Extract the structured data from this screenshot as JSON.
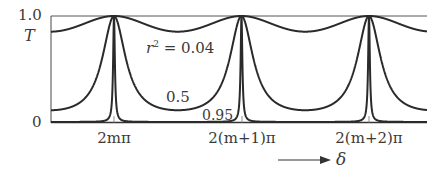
{
  "chart_data": {
    "type": "line",
    "title": "",
    "xlabel": "δ",
    "ylabel": "T",
    "function": "T = 1 / (1 + F sin^2(δ/2)), F = 4r^2/(1-r^2)^2",
    "x_tick_labels": [
      "2mπ",
      "2(m+1)π",
      "2(m+2)π"
    ],
    "x_tick_positions_rad_offset": [
      0,
      6.2832,
      12.5664
    ],
    "x_range_rad_offset": [
      -3.14,
      15.0
    ],
    "y_tick_labels": [
      "0",
      "1.0"
    ],
    "ylim": [
      0,
      1.0
    ],
    "grid": false,
    "legend": "inline curve labels",
    "series": [
      {
        "name": "r² = 0.04",
        "r2": 0.04,
        "F": 0.1736,
        "T_min": 0.852,
        "T_max": 1.0
      },
      {
        "name": "0.5",
        "r2": 0.5,
        "F": 8.0,
        "T_min": 0.111,
        "T_max": 1.0
      },
      {
        "name": "0.95",
        "r2": 0.95,
        "F": 1520.0,
        "T_min": 0.00066,
        "T_max": 1.0
      }
    ],
    "annotations": [
      "r² = 0.04",
      "0.5",
      "0.95",
      "→ δ"
    ]
  },
  "axes": {
    "y_top_label": "1.0",
    "y_axis_symbol": "T",
    "y_bottom_label": "0",
    "x_axis_symbol": "δ"
  },
  "labels": {
    "curve1_prefix": "r",
    "curve1_sup": "2",
    "curve1_value": " = 0.04",
    "curve2": "0.5",
    "curve3": "0.95"
  },
  "colors": {
    "curve": "#2a2a2a",
    "frame": "#555555",
    "text": "#3a3a3a",
    "background": "#ffffff"
  }
}
